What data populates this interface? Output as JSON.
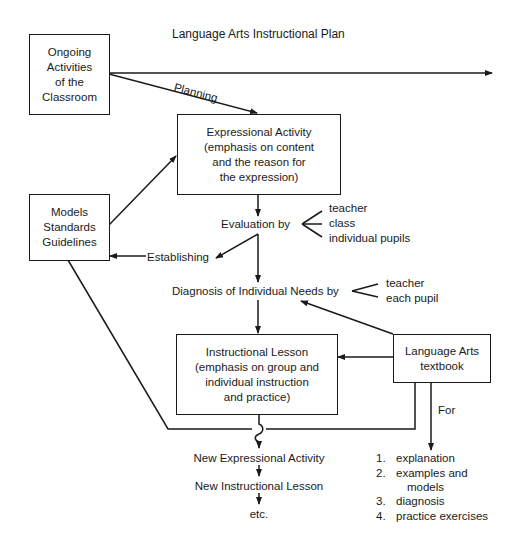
{
  "title": "Language Arts Instructional Plan",
  "boxes": {
    "ongoing": {
      "lines": [
        "Ongoing",
        "Activities",
        "of the",
        "Classroom"
      ]
    },
    "expressional": {
      "lines": [
        "Expressional Activity",
        "(emphasis on content",
        "and the reason for",
        "the expression)"
      ]
    },
    "models": {
      "lines": [
        "Models",
        "Standards",
        "Guidelines"
      ]
    },
    "instructional": {
      "lines": [
        "Instructional Lesson",
        "(emphasis on group and",
        "individual instruction",
        "and practice)"
      ]
    },
    "textbook": {
      "lines": [
        "Language Arts",
        "textbook"
      ]
    }
  },
  "labels": {
    "planning": "Planning",
    "evaluation": "Evaluation by",
    "evaluation_by": [
      "teacher",
      "class",
      "individual pupils"
    ],
    "establishing": "Establishing",
    "diagnosis": "Diagnosis of Individual Needs by",
    "diagnosis_by": [
      "teacher",
      "each pupil"
    ],
    "for": "For"
  },
  "sequence": [
    "New Expressional Activity",
    "New Instructional Lesson",
    "etc."
  ],
  "textbook_uses": [
    {
      "num": "1.",
      "text": "explanation"
    },
    {
      "num": "2.",
      "text": "examples and"
    },
    {
      "num": "",
      "text": "models"
    },
    {
      "num": "3.",
      "text": "diagnosis"
    },
    {
      "num": "4.",
      "text": "practice exercises"
    }
  ]
}
